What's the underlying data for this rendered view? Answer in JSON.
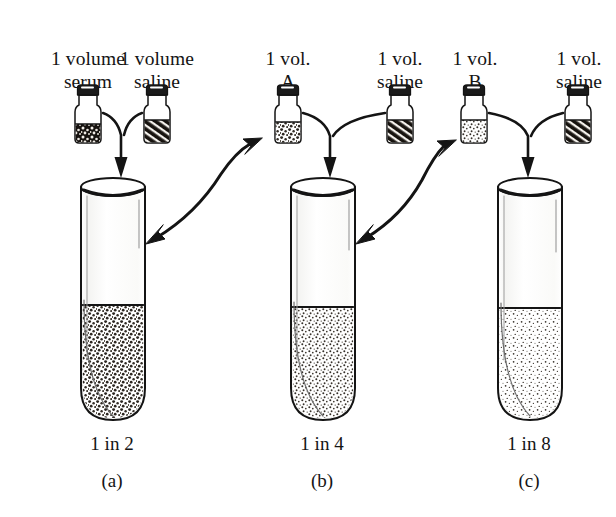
{
  "figure": {
    "type": "serial-dilution-diagram",
    "ink_color": "#141414",
    "background_color": "#ffffff"
  },
  "bottles": [
    {
      "id": "serum",
      "label_line1": "1 volume",
      "label_line2": "serum",
      "fill_pattern": "dark-granular",
      "group": 1,
      "x": 88
    },
    {
      "id": "saline-1",
      "label_line1": "1 volume",
      "label_line2": "saline",
      "fill_pattern": "diagonal-hatch",
      "group": 1,
      "x": 157
    },
    {
      "id": "vol-a",
      "label_line1": "1 vol.",
      "label_line2": "A",
      "fill_pattern": "medium-granular",
      "group": 2,
      "x": 288
    },
    {
      "id": "saline-2",
      "label_line1": "1 vol.",
      "label_line2": "saline",
      "fill_pattern": "diagonal-hatch",
      "group": 2,
      "x": 400
    },
    {
      "id": "vol-b",
      "label_line1": "1 vol.",
      "label_line2": "B",
      "fill_pattern": "light-stipple",
      "group": 3,
      "x": 474
    },
    {
      "id": "saline-3",
      "label_line1": "1 vol.",
      "label_line2": "saline",
      "fill_pattern": "diagonal-hatch",
      "group": 3,
      "x": 578
    }
  ],
  "tubes": [
    {
      "id": "tube-a",
      "ratio": "1 in 2",
      "letter": "(a)",
      "fill_density": "dense",
      "center_x": 112
    },
    {
      "id": "tube-b",
      "ratio": "1 in 4",
      "letter": "(b)",
      "fill_density": "medium",
      "center_x": 322
    },
    {
      "id": "tube-c",
      "ratio": "1 in 8",
      "letter": "(c)",
      "fill_density": "sparse",
      "center_x": 529
    }
  ],
  "arrows": {
    "mix": [
      {
        "id": "mix-arrow-1",
        "from": [
          "serum",
          "saline-1"
        ],
        "to": "tube-a"
      },
      {
        "id": "mix-arrow-2",
        "from": [
          "vol-a",
          "saline-2"
        ],
        "to": "tube-b"
      },
      {
        "id": "mix-arrow-3",
        "from": [
          "vol-b",
          "saline-3"
        ],
        "to": "tube-c"
      }
    ],
    "transfer": [
      {
        "id": "transfer-arrow-1",
        "from": "tube-a",
        "to": "vol-a"
      },
      {
        "id": "transfer-arrow-2",
        "from": "tube-b",
        "to": "vol-b"
      }
    ]
  }
}
